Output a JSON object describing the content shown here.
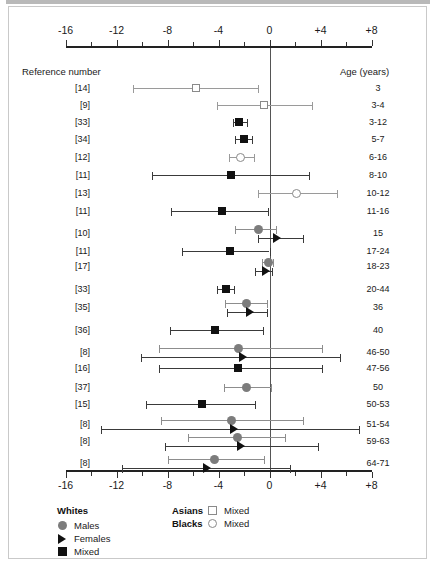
{
  "chart_data": {
    "type": "forest",
    "title": "",
    "xlabel": "",
    "ylabel": "",
    "xlim": [
      -16,
      8
    ],
    "grid": false,
    "zero_reference": 0,
    "axis": {
      "major_ticks": [
        -16,
        -12,
        -8,
        -4,
        0,
        4,
        8
      ],
      "major_labels": [
        "-16",
        "-12",
        "-8",
        "-4",
        "0",
        "+4",
        "+8"
      ],
      "minor_ticks": [
        -14,
        -10,
        -6,
        -2,
        2,
        6
      ],
      "top_axis": true,
      "bottom_axis": true
    },
    "columns": {
      "left_header": "Reference number",
      "right_header": "Age (years)"
    },
    "rows": [
      {
        "ref": "[14]",
        "age": "3",
        "entries": [
          {
            "group": "asians-mixed",
            "marker": "open-square",
            "value": -5.8,
            "low": -10.7,
            "high": -0.9
          }
        ]
      },
      {
        "ref": "[9]",
        "age": "3-4",
        "entries": [
          {
            "group": "asians-mixed",
            "marker": "open-square",
            "value": -0.4,
            "low": -4.1,
            "high": 3.3
          }
        ]
      },
      {
        "ref": "[33]",
        "age": "3-12",
        "entries": [
          {
            "group": "whites-mixed",
            "marker": "black-square",
            "value": -2.4,
            "low": -2.9,
            "high": -1.8
          }
        ]
      },
      {
        "ref": "[34]",
        "age": "5-7",
        "entries": [
          {
            "group": "whites-mixed",
            "marker": "black-square",
            "value": -2.0,
            "low": -2.7,
            "high": -1.4
          }
        ]
      },
      {
        "ref": "[12]",
        "age": "6-16",
        "entries": [
          {
            "group": "blacks-mixed",
            "marker": "open-circle",
            "value": -2.3,
            "low": -3.2,
            "high": -1.2
          }
        ]
      },
      {
        "ref": "[11]",
        "age": "8-10",
        "entries": [
          {
            "group": "whites-mixed",
            "marker": "black-square",
            "value": -3.0,
            "low": -9.2,
            "high": 3.1
          }
        ]
      },
      {
        "ref": "[13]",
        "age": "10-12",
        "entries": [
          {
            "group": "blacks-mixed",
            "marker": "open-circle",
            "value": 2.1,
            "low": -0.9,
            "high": 5.3
          }
        ]
      },
      {
        "ref": "[11]",
        "age": "11-16",
        "entries": [
          {
            "group": "whites-mixed",
            "marker": "black-square",
            "value": -3.7,
            "low": -7.7,
            "high": -0.1
          }
        ]
      },
      {
        "ref": "[10]",
        "age": "15",
        "entries": [
          {
            "group": "whites-males",
            "marker": "gray-circle",
            "value": -0.9,
            "low": -2.7,
            "high": 0.5
          },
          {
            "group": "whites-females",
            "marker": "triangle",
            "value": 0.6,
            "low": -0.9,
            "high": 2.6
          }
        ]
      },
      {
        "ref": "[11]",
        "age": "17-24",
        "entries": [
          {
            "group": "whites-mixed",
            "marker": "black-square",
            "value": -3.1,
            "low": -6.9,
            "high": 0.0
          }
        ]
      },
      {
        "ref": "[17]",
        "age": "18-23",
        "entries": [
          {
            "group": "whites-males",
            "marker": "gray-circle",
            "value": -0.1,
            "low": -0.6,
            "high": 0.3
          },
          {
            "group": "whites-females",
            "marker": "triangle",
            "value": -0.3,
            "low": -1.1,
            "high": 0.2
          }
        ]
      },
      {
        "ref": "[33]",
        "age": "20-44",
        "entries": [
          {
            "group": "whites-mixed",
            "marker": "black-square",
            "value": -3.4,
            "low": -4.1,
            "high": -2.8
          }
        ]
      },
      {
        "ref": "[35]",
        "age": "36",
        "entries": [
          {
            "group": "whites-males",
            "marker": "gray-circle",
            "value": -1.8,
            "low": -3.5,
            "high": -0.2
          },
          {
            "group": "whites-females",
            "marker": "triangle",
            "value": -1.5,
            "low": -3.3,
            "high": -0.2
          }
        ]
      },
      {
        "ref": "[36]",
        "age": "40",
        "entries": [
          {
            "group": "whites-mixed",
            "marker": "black-square",
            "value": -4.3,
            "low": -7.8,
            "high": -0.5
          }
        ]
      },
      {
        "ref": "[8]",
        "age": "46-50",
        "entries": [
          {
            "group": "whites-males",
            "marker": "gray-circle",
            "value": -2.4,
            "low": -8.7,
            "high": 4.1
          },
          {
            "group": "whites-females",
            "marker": "triangle",
            "value": -2.1,
            "low": -10.1,
            "high": 5.5
          }
        ]
      },
      {
        "ref": "[16]",
        "age": "47-56",
        "entries": [
          {
            "group": "whites-mixed",
            "marker": "black-square",
            "value": -2.5,
            "low": -8.7,
            "high": 4.1
          }
        ]
      },
      {
        "ref": "[37]",
        "age": "50",
        "entries": [
          {
            "group": "whites-males",
            "marker": "gray-circle",
            "value": -1.8,
            "low": -3.6,
            "high": 0.1
          }
        ]
      },
      {
        "ref": "[15]",
        "age": "50-53",
        "entries": [
          {
            "group": "whites-mixed",
            "marker": "black-square",
            "value": -5.3,
            "low": -9.7,
            "high": -1.1
          }
        ]
      },
      {
        "ref": "[8]",
        "age": "51-54",
        "entries": [
          {
            "group": "whites-males",
            "marker": "gray-circle",
            "value": -3.0,
            "low": -8.5,
            "high": 2.6
          },
          {
            "group": "whites-females",
            "marker": "triangle",
            "value": -2.8,
            "low": -13.2,
            "high": 7.0
          }
        ]
      },
      {
        "ref": "[8]",
        "age": "59-63",
        "entries": [
          {
            "group": "whites-males",
            "marker": "gray-circle",
            "value": -2.5,
            "low": -6.4,
            "high": 1.2
          },
          {
            "group": "whites-females",
            "marker": "triangle",
            "value": -2.2,
            "low": -8.2,
            "high": 3.8
          }
        ]
      },
      {
        "ref": "[8]",
        "age": "64-71",
        "entries": [
          {
            "group": "whites-males",
            "marker": "gray-circle",
            "value": -4.3,
            "low": -8.0,
            "high": -0.4
          },
          {
            "group": "whites-females",
            "marker": "triangle",
            "value": -4.9,
            "low": -11.6,
            "high": 1.6
          }
        ]
      }
    ],
    "legend": {
      "position": "bottom-left",
      "groups": [
        {
          "title": "Whites",
          "items": [
            {
              "label": "Males",
              "marker": "gray-circle"
            },
            {
              "label": "Females",
              "marker": "triangle"
            },
            {
              "label": "Mixed",
              "marker": "black-square"
            }
          ]
        },
        {
          "title": "Asians",
          "items": [
            {
              "label": "Mixed",
              "marker": "open-square"
            }
          ]
        },
        {
          "title": "Blacks",
          "items": [
            {
              "label": "Mixed",
              "marker": "open-circle"
            }
          ]
        }
      ]
    },
    "colors": {
      "black_marker": "#111111",
      "gray_marker": "#7c7c7c",
      "open_marker_stroke": "#8a8a8a",
      "axis": "#222222",
      "zero_line": "#555555"
    }
  }
}
